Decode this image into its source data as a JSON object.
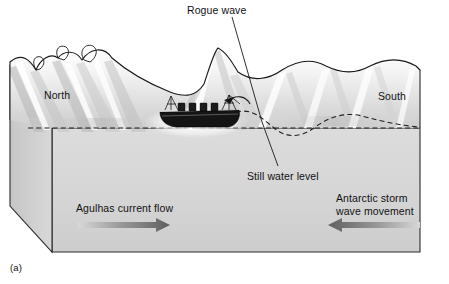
{
  "figure": {
    "caption": "(a)",
    "type": "ocean-cross-section-block-diagram"
  },
  "labels": {
    "rogue_wave": "Rogue wave",
    "north": "North",
    "south": "South",
    "still_water_level": "Still water level",
    "agulhas": "Agulhas current flow",
    "antarctic_line1": "Antarctic storm",
    "antarctic_line2": "wave movement"
  },
  "colors": {
    "outline": "#1a1a1a",
    "block_face": "#d6d6d6",
    "block_side": "#cfcfcf",
    "water_light": "#ffffff",
    "water_mid": "#e0e0e0",
    "water_shadow": "#b9b9b9",
    "hull_dark": "#141414",
    "arrow_dark": "#6e6e6e",
    "arrow_light": "#d2d2d2",
    "background": "#ffffff",
    "text": "#111111"
  },
  "annotations": {
    "leader_rogue_top": "leader from Rogue wave label down through wave crest",
    "leader_still_bottom": "leader from wave down to Still water level label",
    "dashed_still_line": "horizontal dashed line marking still water level",
    "dashed_swell_curve": "dashed sinusoidal curve showing southern swell profile"
  },
  "arrows": {
    "left_direction": "right",
    "right_direction": "left"
  },
  "ship": {
    "name": "cargo-ship",
    "orientation": "bow-right",
    "deckhouses": 5,
    "masts": 2
  }
}
